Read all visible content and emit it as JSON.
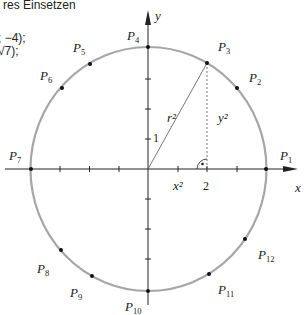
{
  "text": {
    "line1": "res Einsetzen",
    "line2": "; −4);",
    "line3": "√7);"
  },
  "axes": {
    "x_label": "x",
    "y_label": "y",
    "tick_1": "1",
    "tick_2": "2"
  },
  "segments": {
    "hyp": "r²",
    "vert": "y²",
    "horiz": "x²"
  },
  "points": [
    {
      "name": "P",
      "sub": "1"
    },
    {
      "name": "P",
      "sub": "2"
    },
    {
      "name": "P",
      "sub": "3"
    },
    {
      "name": "P",
      "sub": "4"
    },
    {
      "name": "P",
      "sub": "5"
    },
    {
      "name": "P",
      "sub": "6"
    },
    {
      "name": "P",
      "sub": "7"
    },
    {
      "name": "P",
      "sub": "8"
    },
    {
      "name": "P",
      "sub": "9"
    },
    {
      "name": "P",
      "sub": "10"
    },
    {
      "name": "P",
      "sub": "11"
    },
    {
      "name": "P",
      "sub": "12"
    }
  ],
  "colors": {
    "circle": "#a6a6a6",
    "ink": "#222222"
  }
}
